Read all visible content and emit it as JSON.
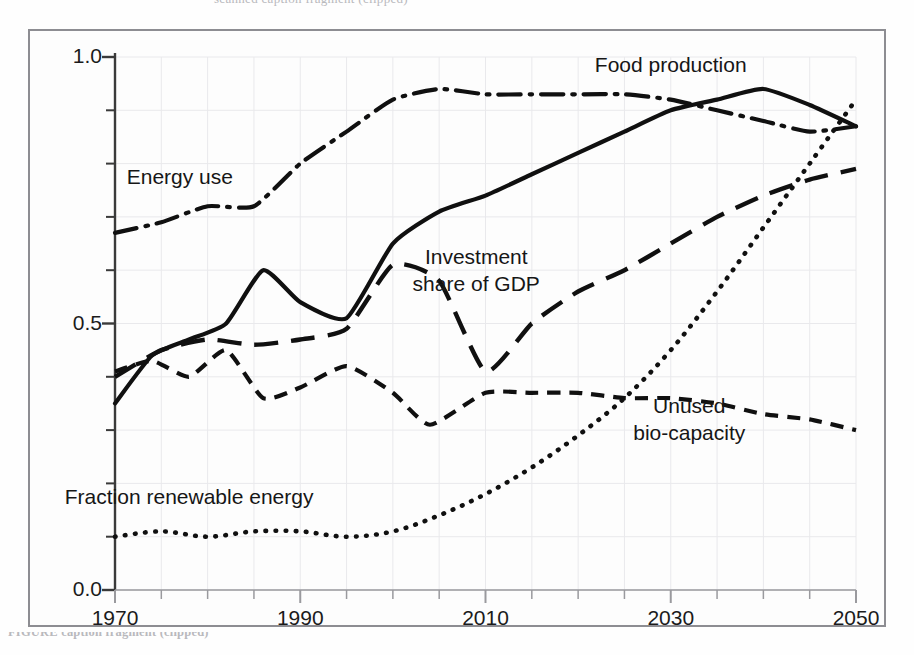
{
  "page": {
    "top_cut_text": "scanned caption fragment (clipped)",
    "bottom_cut_text": "FIGURE caption fragment (clipped)"
  },
  "chart_data": {
    "type": "line",
    "title": "",
    "xlabel": "",
    "ylabel": "",
    "xlim": [
      1970,
      2050
    ],
    "ylim": [
      0.0,
      1.0
    ],
    "grid": true,
    "legend_position": "inline-annotations",
    "x_ticks": [
      1970,
      1990,
      2010,
      2030,
      2050
    ],
    "x_tick_labels": [
      "1970",
      "1990",
      "2010",
      "2030",
      "2050"
    ],
    "x_minor_tick_step": 5,
    "y_ticks": [
      0.0,
      0.5,
      1.0
    ],
    "y_tick_labels": [
      "0.0",
      "0.5",
      "1.0"
    ],
    "y_minor_tick_step": 0.1,
    "series": [
      {
        "name": "Food production",
        "style": "solid",
        "color": "#101010",
        "x": [
          1970,
          1974,
          1978,
          1982,
          1986,
          1990,
          1995,
          2000,
          2005,
          2010,
          2015,
          2020,
          2025,
          2030,
          2035,
          2040,
          2045,
          2050
        ],
        "values": [
          0.35,
          0.44,
          0.47,
          0.5,
          0.6,
          0.54,
          0.51,
          0.65,
          0.71,
          0.74,
          0.78,
          0.82,
          0.86,
          0.9,
          0.92,
          0.94,
          0.91,
          0.87
        ]
      },
      {
        "name": "Energy use",
        "style": "dash-dot",
        "color": "#101010",
        "x": [
          1970,
          1975,
          1980,
          1985,
          1990,
          1995,
          2000,
          2005,
          2010,
          2015,
          2020,
          2025,
          2030,
          2035,
          2040,
          2045,
          2050
        ],
        "values": [
          0.67,
          0.69,
          0.72,
          0.72,
          0.8,
          0.86,
          0.92,
          0.94,
          0.93,
          0.93,
          0.93,
          0.93,
          0.92,
          0.9,
          0.88,
          0.86,
          0.87
        ]
      },
      {
        "name": "Investment share of GDP",
        "style": "long-dash",
        "color": "#101010",
        "x": [
          1970,
          1975,
          1980,
          1985,
          1990,
          1995,
          2000,
          2005,
          2010,
          2015,
          2020,
          2025,
          2030,
          2035,
          2040,
          2045,
          2050
        ],
        "values": [
          0.4,
          0.45,
          0.47,
          0.46,
          0.47,
          0.49,
          0.61,
          0.58,
          0.41,
          0.5,
          0.56,
          0.6,
          0.65,
          0.7,
          0.74,
          0.77,
          0.79
        ]
      },
      {
        "name": "Unused bio-capacity",
        "style": "short-dash",
        "color": "#101010",
        "x": [
          1970,
          1974,
          1978,
          1982,
          1986,
          1990,
          1995,
          2000,
          2004,
          2010,
          2015,
          2020,
          2025,
          2030,
          2035,
          2040,
          2045,
          2050
        ],
        "values": [
          0.41,
          0.43,
          0.4,
          0.45,
          0.36,
          0.38,
          0.42,
          0.37,
          0.31,
          0.37,
          0.37,
          0.37,
          0.36,
          0.36,
          0.35,
          0.33,
          0.32,
          0.3
        ]
      },
      {
        "name": "Fraction renewable energy",
        "style": "dotted",
        "color": "#101010",
        "x": [
          1970,
          1975,
          1980,
          1985,
          1990,
          1995,
          2000,
          2005,
          2010,
          2015,
          2020,
          2025,
          2030,
          2035,
          2040,
          2045,
          2050
        ],
        "values": [
          0.1,
          0.11,
          0.1,
          0.11,
          0.11,
          0.1,
          0.11,
          0.14,
          0.18,
          0.23,
          0.29,
          0.36,
          0.45,
          0.56,
          0.68,
          0.8,
          0.92
        ]
      }
    ],
    "annotations": [
      {
        "text": "Energy use",
        "x": 1977,
        "y": 0.775
      },
      {
        "text": "Food production",
        "x": 2030,
        "y": 0.985
      },
      {
        "text": "Investment",
        "x": 2009,
        "y": 0.625
      },
      {
        "text": "share of GDP",
        "x": 2009,
        "y": 0.575
      },
      {
        "text": "Unused",
        "x": 2032,
        "y": 0.345
      },
      {
        "text": "bio-capacity",
        "x": 2032,
        "y": 0.295
      },
      {
        "text": "Fraction renewable energy",
        "x": 1978,
        "y": 0.175
      }
    ]
  }
}
